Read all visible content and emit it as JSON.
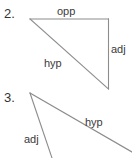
{
  "page": {
    "background_color": "#ffffff",
    "line_color": "#8c8c8c",
    "text_color": "#3a3a3a",
    "number_color": "#333333",
    "width": 132,
    "height": 158
  },
  "problems": [
    {
      "number": "2.",
      "shape": "right-triangle",
      "labels": {
        "opposite": "opp",
        "adjacent": "adj",
        "hypotenuse": "hyp"
      }
    },
    {
      "number": "3.",
      "shape": "triangle-partial",
      "labels": {
        "adjacent": "adj",
        "hypotenuse": "hyp"
      }
    }
  ]
}
